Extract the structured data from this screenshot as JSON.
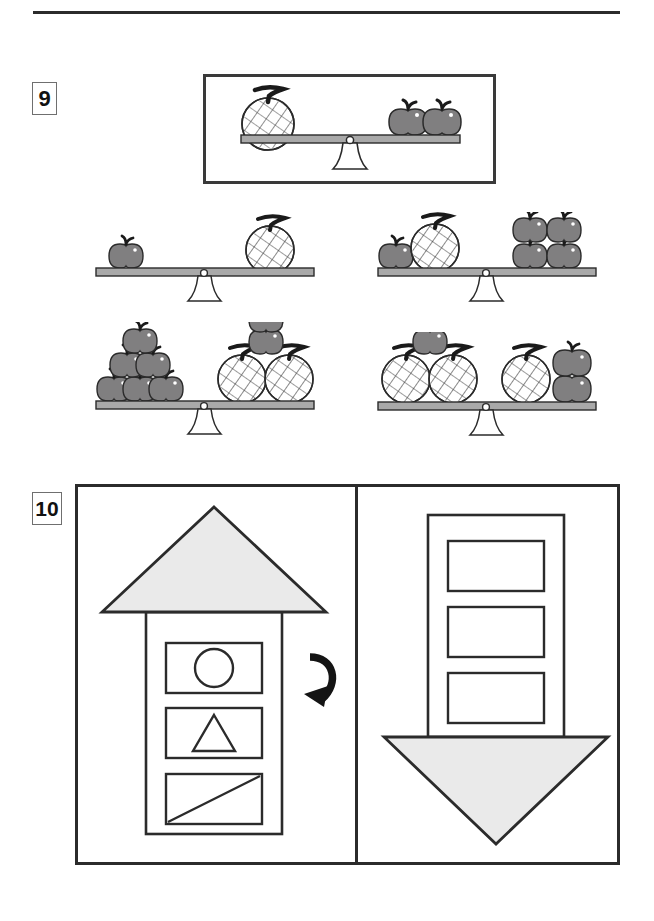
{
  "page": {
    "type": "worksheet-page",
    "width": 654,
    "height": 921,
    "background": "#ffffff",
    "rule_color": "#2b2b2b"
  },
  "colors": {
    "ink": "#2b2b2b",
    "apple_fill": "#807f80",
    "apple_stem": "#202020",
    "melon_fill": "#ffffff",
    "melon_net": "#3a3a3a",
    "beam_fill": "#a9a9a9",
    "fulcrum_fill": "#ffffff",
    "shape_fill": "#eaeaea",
    "badge_border": "#6f6f6f"
  },
  "questions": [
    {
      "number": "9",
      "type": "balance-scale-analogy",
      "prompt": {
        "name": "prompt-scale",
        "state": "level",
        "left_pan": {
          "melons": 1,
          "apples": 0
        },
        "right_pan": {
          "melons": 0,
          "apples": 2
        }
      },
      "options": [
        {
          "id": "A",
          "name": "option-top-left",
          "state": "level",
          "left_pan": {
            "melons": 0,
            "apples": 1
          },
          "right_pan": {
            "melons": 1,
            "apples": 0
          }
        },
        {
          "id": "B",
          "name": "option-top-right",
          "state": "level",
          "left_pan": {
            "melons": 1,
            "apples": 1
          },
          "right_pan": {
            "melons": 0,
            "apples": 4
          }
        },
        {
          "id": "C",
          "name": "option-bottom-left",
          "state": "level",
          "left_pan": {
            "melons": 0,
            "apples": 6
          },
          "right_pan": {
            "melons": 2,
            "apples": 2
          }
        },
        {
          "id": "D",
          "name": "option-bottom-right",
          "state": "level",
          "left_pan": {
            "melons": 2,
            "apples": 1
          },
          "right_pan": {
            "melons": 1,
            "apples": 2
          }
        }
      ]
    },
    {
      "number": "10",
      "type": "rotation-transformation",
      "left_panel": {
        "name": "arrow-up-figure",
        "arrow_direction": "up",
        "head_fill": "#eaeaea",
        "cells": [
          {
            "position": 1,
            "symbol": "circle"
          },
          {
            "position": 2,
            "symbol": "triangle"
          },
          {
            "position": 3,
            "symbol": "diagonal-line"
          }
        ]
      },
      "operator": {
        "name": "rotate-arrow",
        "glyph": "curved-arrow-clockwise",
        "meaning": "rotate"
      },
      "right_panel": {
        "name": "arrow-down-figure",
        "arrow_direction": "down",
        "head_fill": "#eaeaea",
        "cells": [
          {
            "position": 1,
            "symbol": "empty"
          },
          {
            "position": 2,
            "symbol": "empty"
          },
          {
            "position": 3,
            "symbol": "empty"
          }
        ]
      }
    }
  ]
}
